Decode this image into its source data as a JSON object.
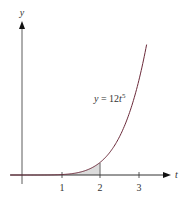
{
  "chart_data": {
    "type": "line",
    "title": "",
    "xlabel": "t",
    "ylabel": "y",
    "series": [
      {
        "name": "y = 12t^5",
        "formula": "12*t^5"
      }
    ],
    "x_ticks": [
      "1",
      "2",
      "3"
    ],
    "xlim": [
      -0.1,
      3.8
    ],
    "shaded_region": {
      "from": 1,
      "to": 2,
      "description": "area under curve between t=1 and t=2"
    },
    "annotation": {
      "text_prefix": "y = 12",
      "var": "t",
      "exp": "5"
    },
    "grid": false,
    "colors": {
      "curve": "#6b2a3a",
      "shade": "#d9d9d9",
      "axis": "#333333"
    }
  }
}
